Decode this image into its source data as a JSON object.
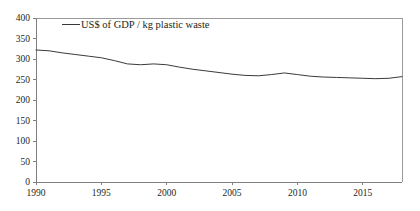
{
  "chart_data": {
    "type": "line",
    "title": "",
    "xlabel": "",
    "ylabel": "",
    "xlim": [
      1990,
      2018
    ],
    "ylim": [
      0,
      400
    ],
    "grid": false,
    "legend_position": "top-left-inside",
    "yticks": [
      0,
      50,
      100,
      150,
      200,
      250,
      300,
      350,
      400
    ],
    "xticks": [
      1990,
      1995,
      2000,
      2005,
      2010,
      2015
    ],
    "ytick_labels": [
      "0",
      "50",
      "100",
      "150",
      "200",
      "250",
      "300",
      "350",
      "400"
    ],
    "xtick_labels": [
      "1990",
      "1995",
      "2000",
      "2005",
      "2010",
      "2015"
    ],
    "series": [
      {
        "name": "US$ of GDP / kg plastic waste",
        "color": "#3a3a3a",
        "x": [
          1990,
          1991,
          1992,
          1993,
          1994,
          1995,
          1996,
          1997,
          1998,
          1999,
          2000,
          2001,
          2002,
          2003,
          2004,
          2005,
          2006,
          2007,
          2008,
          2009,
          2010,
          2011,
          2012,
          2013,
          2014,
          2015,
          2016,
          2017,
          2018
        ],
        "values": [
          322,
          320,
          315,
          311,
          307,
          303,
          296,
          288,
          286,
          288,
          286,
          280,
          275,
          271,
          267,
          263,
          260,
          259,
          262,
          266,
          262,
          258,
          256,
          255,
          254,
          253,
          252,
          253,
          257
        ]
      }
    ]
  },
  "legend": {
    "entries": [
      {
        "label": "US$ of GDP / kg plastic waste",
        "color": "#3a3a3a"
      }
    ]
  },
  "axes": {
    "y_max_label": "400",
    "y_min_label": "0",
    "x_first_label": "1990",
    "x_last_label": "2015"
  },
  "colors": {
    "line": "#3a3a3a",
    "axis": "#808080",
    "frame": "#9a9a9a",
    "text": "#231f20",
    "background": "#ffffff"
  }
}
